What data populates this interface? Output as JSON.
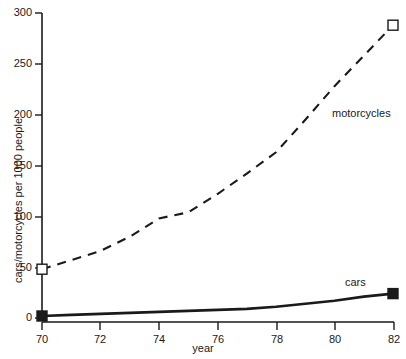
{
  "chart_data": {
    "type": "line",
    "title": "",
    "subtitle": "",
    "xlabel": "year",
    "ylabel": "cars/motorcycles per 1000 people",
    "xlim": [
      70,
      82
    ],
    "ylim": [
      0,
      300
    ],
    "xticks": [
      70,
      72,
      74,
      76,
      78,
      80,
      82
    ],
    "xtick_labels": [
      "70",
      "72",
      "74",
      "76",
      "78",
      "80",
      "82"
    ],
    "yticks": [
      0,
      50,
      100,
      150,
      200,
      250,
      300
    ],
    "ytick_labels": [
      "0",
      "50",
      "100",
      "150",
      "200",
      "250",
      "300"
    ],
    "grid": false,
    "legend_position": "inline-annotation",
    "x": [
      70,
      71,
      72,
      73,
      74,
      75,
      76,
      77,
      78,
      79,
      80,
      81,
      82
    ],
    "series": [
      {
        "name": "motorcycles",
        "style": "dashed",
        "marker": "open-square",
        "marker_at": [
          70,
          82
        ],
        "color": "#000000",
        "values": [
          48,
          57,
          66,
          80,
          98,
          104,
          122,
          142,
          163,
          195,
          228,
          258,
          288
        ]
      },
      {
        "name": "cars",
        "style": "solid",
        "marker": "filled-square",
        "marker_at": [
          70,
          82
        ],
        "color": "#000000",
        "values": [
          2,
          3,
          4,
          5,
          6,
          7,
          8,
          9,
          11,
          14,
          17,
          21,
          24
        ]
      }
    ],
    "annotations": [
      {
        "text": "motorcycles",
        "x": 82,
        "y": 300
      },
      {
        "text": "cars",
        "x": 82,
        "y": 0
      }
    ]
  },
  "axis": {
    "x_title": "year",
    "y_title": "cars/motorcycles per 1000 people"
  },
  "labels": {
    "motorcycles": "motorcycles",
    "cars": "cars"
  }
}
